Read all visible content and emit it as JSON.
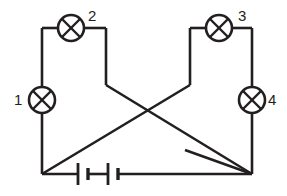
{
  "diagram": {
    "type": "circuit-schematic",
    "background_color": "#ffffff",
    "line_color": "#231f20",
    "canvas": {
      "width": 287,
      "height": 196
    }
  },
  "labels": [
    {
      "id": "lamp-1",
      "text": "1",
      "x": 14,
      "y": 92
    },
    {
      "id": "lamp-2",
      "text": "2",
      "x": 88,
      "y": 8
    },
    {
      "id": "lamp-3",
      "text": "3",
      "x": 238,
      "y": 8
    },
    {
      "id": "lamp-4",
      "text": "4",
      "x": 268,
      "y": 92
    }
  ],
  "components": {
    "lamps": [
      {
        "name": "lamp-1",
        "label": "1",
        "cx": 42,
        "cy": 100,
        "r": 13,
        "orientation": "vertical"
      },
      {
        "name": "lamp-2",
        "label": "2",
        "cx": 71,
        "cy": 28,
        "r": 13,
        "orientation": "horizontal"
      },
      {
        "name": "lamp-3",
        "label": "3",
        "cx": 219,
        "cy": 28,
        "r": 13,
        "orientation": "horizontal"
      },
      {
        "name": "lamp-4",
        "label": "4",
        "cx": 252,
        "cy": 100,
        "r": 13,
        "orientation": "vertical"
      }
    ],
    "battery": {
      "name": "battery",
      "cells": 2,
      "y": 174,
      "plates": [
        {
          "kind": "long",
          "x": 78,
          "half_height": 11
        },
        {
          "kind": "short",
          "x": 87,
          "half_height": 6
        },
        {
          "kind": "long",
          "x": 108,
          "half_height": 11
        },
        {
          "kind": "short",
          "x": 117,
          "half_height": 6
        }
      ],
      "lead_left_from_x": 42,
      "lead_left_to_x": 78,
      "lead_right_from_x": 117,
      "lead_right_to_x": 172
    },
    "switch": {
      "name": "switch",
      "state": "open",
      "pivot_x": 185,
      "pivot_y": 174,
      "blade_tip_x": 252,
      "blade_tip_y": 174,
      "blade_open_x": 185,
      "blade_open_y": 150
    }
  },
  "wires": [
    {
      "name": "wire-left-vertical-top",
      "points": "42,28 42,87"
    },
    {
      "name": "wire-left-vertical-bottom",
      "points": "42,113 42,174"
    },
    {
      "name": "wire-top-left-to-lamp2",
      "points": "42,28 58,28"
    },
    {
      "name": "wire-lamp2-to-inner-left",
      "points": "84,28 106,28"
    },
    {
      "name": "wire-inner-left-vertical",
      "points": "106,28 106,85"
    },
    {
      "name": "wire-top-right-to-lamp3",
      "points": "252,28 232,28"
    },
    {
      "name": "wire-lamp3-to-inner-right",
      "points": "206,28 190,28"
    },
    {
      "name": "wire-inner-right-vertical",
      "points": "190,28 190,85"
    },
    {
      "name": "wire-right-vertical-top",
      "points": "252,28 252,87"
    },
    {
      "name": "wire-right-vertical-bottom",
      "points": "252,113 252,174"
    },
    {
      "name": "wire-diagonal-left-down",
      "points": "106,85 252,174"
    },
    {
      "name": "wire-diagonal-right-down",
      "points": "190,85 42,174"
    },
    {
      "name": "wire-bottom-left-lead",
      "points": "42,174 78,174"
    },
    {
      "name": "wire-bottom-right-lead",
      "points": "117,174 185,174"
    },
    {
      "name": "wire-switch-contact",
      "points": "185,174 252,174"
    }
  ]
}
